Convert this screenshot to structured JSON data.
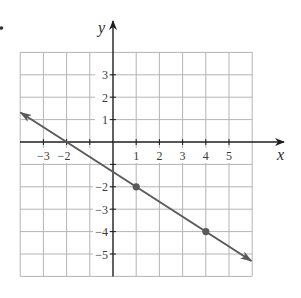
{
  "figure": {
    "bullet": "•",
    "axes": {
      "x_label": "x",
      "y_label": "y",
      "x_range": [
        -4,
        6
      ],
      "y_range": [
        -6,
        4
      ],
      "x_ticks": [
        "−3",
        "−2",
        "1",
        "2",
        "3",
        "4",
        "5"
      ],
      "x_tick_values": [
        -3,
        -2,
        1,
        2,
        3,
        4,
        5
      ],
      "y_ticks": [
        "3",
        "2",
        "1",
        "−2",
        "−3",
        "−4",
        "−5"
      ],
      "y_tick_values": [
        3,
        2,
        1,
        -2,
        -3,
        -4,
        -5
      ],
      "grid": true
    },
    "line": {
      "equation": "y = -2/3 x - 4/3",
      "slope": "-2/3",
      "x_intercept": -2,
      "y_intercept": -1.333,
      "points": [
        {
          "x": 1,
          "y": -2
        },
        {
          "x": 4,
          "y": -4
        }
      ],
      "arrows": "both ends",
      "color": "#5a5a5a"
    },
    "colors": {
      "grid": "#b0b0b0",
      "axis": "#2a2a2a",
      "line": "#5a5a5a"
    }
  }
}
